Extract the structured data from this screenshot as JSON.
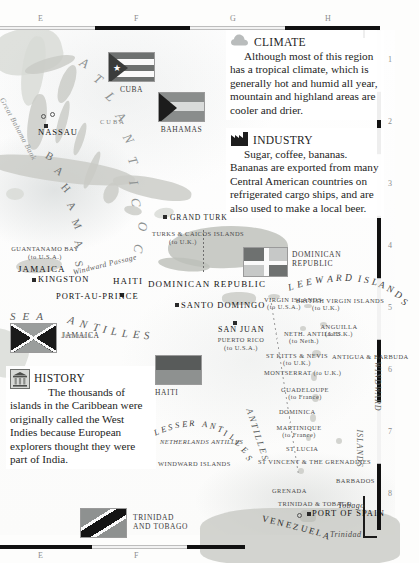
{
  "page": {
    "margins": {
      "top_letters": [
        "E",
        "F",
        "G",
        "H"
      ],
      "bottom_letters": [
        "E",
        "F"
      ],
      "right_numbers": [
        "1",
        "2",
        "3",
        "4",
        "5",
        "6",
        "7",
        "8"
      ]
    }
  },
  "info_panels": [
    {
      "id": "climate",
      "icon": "cloud-icon",
      "heading": "CLIMATE",
      "body": "Although most of this region has a tropical climate, which is generally hot and humid all year, mountain and highland areas are cooler and drier."
    },
    {
      "id": "industry",
      "icon": "factory-icon",
      "heading": "INDUSTRY",
      "body": "Sugar, coffee, bananas. Bananas are exported from many Central American countries on refrigerated cargo ships, and are also used to make a local beer."
    },
    {
      "id": "history",
      "icon": "museum-building-icon",
      "heading": "HISTORY",
      "body": "The thousands of islands in the Caribbean were originally called the West Indies because European explorers thought they were part of India."
    }
  ],
  "flags": [
    {
      "id": "cuba",
      "name": "CUBA",
      "type": "cuba",
      "x": 108,
      "y": 52,
      "w": 47,
      "h": 30
    },
    {
      "id": "bahamas",
      "name": "BAHAMAS",
      "type": "bahamas",
      "x": 158,
      "y": 92,
      "w": 47,
      "h": 30
    },
    {
      "id": "dominican-republic",
      "name": "DOMINICAN REPUBLIC",
      "type": "dominican",
      "x": 243,
      "y": 247,
      "w": 45,
      "h": 30
    },
    {
      "id": "jamaica",
      "name": "JAMAICA",
      "type": "jamaica",
      "x": 10,
      "y": 323,
      "w": 47,
      "h": 30
    },
    {
      "id": "haiti",
      "name": "HAITI",
      "type": "haiti",
      "x": 155,
      "y": 355,
      "w": 47,
      "h": 30
    },
    {
      "id": "trinidad-and-tobago",
      "name": "TRINIDAD AND TOBAGO",
      "type": "trinidad",
      "x": 80,
      "y": 508,
      "w": 47,
      "h": 30
    }
  ],
  "map_labels": {
    "oceans": [
      {
        "text": "ATLANTIC OCEAN",
        "id": "atlantic-ocean"
      },
      {
        "text": "CARIBBEAN SEA",
        "id": "caribbean-sea-partial"
      }
    ],
    "places": [
      {
        "text": "CUBA",
        "id": "cuba-island"
      },
      {
        "text": "NASSAU",
        "id": "nassau"
      },
      {
        "text": "BAHAMAS",
        "id": "bahamas-arc"
      },
      {
        "text": "Great Bahama Bank",
        "id": "great-bahama-bank"
      },
      {
        "text": "GRAND TURK",
        "id": "grand-turk"
      },
      {
        "text": "TURKS & CAICOS ISLANDS",
        "id": "turks-caicos",
        "note": "(to U.K.)"
      },
      {
        "text": "GUANTANAMO BAY",
        "id": "guantanamo-bay",
        "note": "(to U.S.A.)"
      },
      {
        "text": "JAMAICA",
        "id": "jamaica-island"
      },
      {
        "text": "KINGSTON",
        "id": "kingston"
      },
      {
        "text": "Windward Passage",
        "id": "windward-passage"
      },
      {
        "text": "HAITI",
        "id": "haiti-country"
      },
      {
        "text": "PORT-AU-PRINCE",
        "id": "port-au-prince"
      },
      {
        "text": "DOMINICAN REPUBLIC",
        "id": "dominican-republic-country"
      },
      {
        "text": "SANTO DOMINGO",
        "id": "santo-domingo"
      },
      {
        "text": "SAN JUAN",
        "id": "san-juan"
      },
      {
        "text": "PUERTO RICO",
        "id": "puerto-rico",
        "note": "(to U.S.A.)"
      },
      {
        "text": "SEA",
        "id": "sea-word"
      },
      {
        "text": "ANTILLES",
        "id": "antilles-word"
      },
      {
        "text": "Jamaica",
        "id": "jamaica-italic"
      },
      {
        "text": "VIRGIN ISLANDS",
        "id": "virgin-islands",
        "note": "(to U.S.A.)"
      },
      {
        "text": "BRITISH VIRGIN ISLANDS",
        "id": "british-virgin-islands",
        "note": "(to U.K.)"
      },
      {
        "text": "ANGUILLA",
        "id": "anguilla",
        "note": "(to U.K.)"
      },
      {
        "text": "NETH. ANTILLES",
        "id": "neth-antilles-north",
        "note": "(to Neth.)"
      },
      {
        "text": "ST KITTS & NEVIS",
        "id": "st-kitts-nevis",
        "note": "(to U.K.)"
      },
      {
        "text": "MONTSERRAT",
        "id": "montserrat",
        "note": "(to U.K.)"
      },
      {
        "text": "ANTIGUA & BARBUDA",
        "id": "antigua-barbuda"
      },
      {
        "text": "GUADELOUPE",
        "id": "guadeloupe",
        "note": "(to France)"
      },
      {
        "text": "DOMINICA",
        "id": "dominica"
      },
      {
        "text": "MARTINIQUE",
        "id": "martinique",
        "note": "(to France)"
      },
      {
        "text": "ST LUCIA",
        "id": "st-lucia"
      },
      {
        "text": "ST VINCENT & THE GRENADINES",
        "id": "st-vincent-grenadines"
      },
      {
        "text": "BARBADOS",
        "id": "barbados"
      },
      {
        "text": "GRENADA",
        "id": "grenada"
      },
      {
        "text": "TRINIDAD & TOBAGO",
        "id": "trinidad-tobago-country"
      },
      {
        "text": "PORT OF SPAIN",
        "id": "port-of-spain"
      },
      {
        "text": "Trinidad",
        "id": "trinidad-island"
      },
      {
        "text": "Tobago",
        "id": "tobago-island"
      },
      {
        "text": "VENEZUELA",
        "id": "venezuela"
      },
      {
        "text": "LEEWARD ISLANDS",
        "id": "leeward-islands"
      },
      {
        "text": "LESSER ANTILLES",
        "id": "lesser-antilles"
      },
      {
        "text": "WINDWARD ISLANDS",
        "id": "windward-islands"
      },
      {
        "text": "NETHERLANDS ANTILLES",
        "id": "netherlands-antilles-label"
      },
      {
        "text": "ABC ISL.",
        "id": "abc-islands",
        "note": "(to Neth.)"
      }
    ]
  },
  "colors": {
    "ink": "#1e1e1e",
    "land": "#c9cbc6",
    "water": "#8e9292",
    "flag_dark": "#4a4a4a",
    "flag_mid": "#8e8e8e",
    "flag_light": "#cfcfcf",
    "rule_black": "#111111"
  }
}
